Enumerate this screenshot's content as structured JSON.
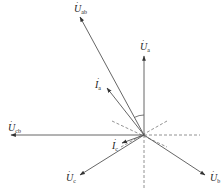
{
  "diagram": {
    "type": "phasor-diagram",
    "origin": {
      "x": 144,
      "y": 135
    },
    "colors": {
      "line": "#555555",
      "dashed": "#777777",
      "text": "#222222",
      "background": "#ffffff"
    },
    "phasors": [
      {
        "id": "Uab",
        "symbol": "U",
        "subscript": "ab",
        "kind": "voltage",
        "tip": {
          "x": 80,
          "y": 17
        },
        "label_pos": {
          "x": 74,
          "y": 4
        }
      },
      {
        "id": "Ua",
        "symbol": "U",
        "subscript": "a",
        "kind": "voltage",
        "tip": {
          "x": 144,
          "y": 56
        },
        "label_pos": {
          "x": 140,
          "y": 42
        }
      },
      {
        "id": "Ia",
        "symbol": "I",
        "subscript": "a",
        "kind": "current",
        "tip": {
          "x": 107,
          "y": 88
        },
        "label_pos": {
          "x": 95,
          "y": 80
        }
      },
      {
        "id": "Ucb",
        "symbol": "U",
        "subscript": "cb",
        "kind": "voltage",
        "tip": {
          "x": 11,
          "y": 135
        },
        "label_pos": {
          "x": 8,
          "y": 123
        }
      },
      {
        "id": "Ic",
        "symbol": "I",
        "subscript": "c",
        "kind": "current",
        "tip": {
          "x": 122,
          "y": 143
        },
        "label_pos": {
          "x": 112,
          "y": 141
        }
      },
      {
        "id": "Uc",
        "symbol": "U",
        "subscript": "c",
        "kind": "voltage",
        "tip": {
          "x": 80,
          "y": 175
        },
        "label_pos": {
          "x": 66,
          "y": 173
        }
      },
      {
        "id": "Ub",
        "symbol": "U",
        "subscript": "b",
        "kind": "voltage",
        "tip": {
          "x": 205,
          "y": 175
        },
        "label_pos": {
          "x": 210,
          "y": 173
        }
      }
    ],
    "dashed_lines": [
      {
        "from": {
          "x": 144,
          "y": 135
        },
        "to": {
          "x": 200,
          "y": 135
        }
      },
      {
        "from": {
          "x": 144,
          "y": 135
        },
        "to": {
          "x": 144,
          "y": 190
        }
      },
      {
        "from": {
          "x": 112,
          "y": 121
        },
        "to": {
          "x": 167,
          "y": 147
        }
      },
      {
        "from": {
          "x": 167,
          "y": 121
        },
        "to": {
          "x": 121,
          "y": 147
        }
      }
    ],
    "angle_arc": {
      "center": {
        "x": 144,
        "y": 135
      },
      "radius": 20,
      "between": [
        "Ua",
        "Uab"
      ]
    }
  }
}
